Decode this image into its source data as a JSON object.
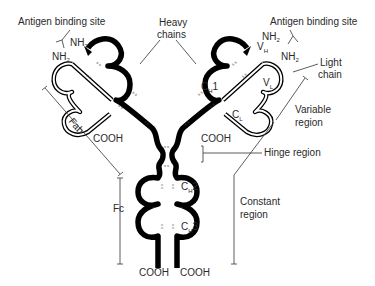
{
  "diagram": {
    "type": "antibody-structure",
    "labels": {
      "antigen_binding_site_left": "Antigen binding site",
      "antigen_binding_site_right": "Antigen binding site",
      "heavy_chains_line1": "Heavy",
      "heavy_chains_line2": "chains",
      "light_chain_line1": "Light",
      "light_chain_line2": "chain",
      "variable_region_line1": "Variable",
      "variable_region_line2": "region",
      "hinge_region": "Hinge region",
      "constant_region_line1": "Constant",
      "constant_region_line2": "region",
      "fab": "Fab",
      "fc": "Fc"
    },
    "termini": {
      "nh2": "NH",
      "nh2_sub": "2",
      "cooh": "COOH"
    },
    "domains": {
      "vh": "V",
      "vh_sub": "H",
      "vl": "V",
      "vl_sub": "L",
      "ch1": "C",
      "ch1_sub": "H",
      "ch1_num": "1",
      "cl": "C",
      "cl_sub": "L",
      "ch2": "C",
      "ch2_sub": "H",
      "ch2_num": "2",
      "ch3": "C",
      "ch3_sub": "H",
      "ch3_num": "3"
    },
    "disulfide": "s s"
  }
}
